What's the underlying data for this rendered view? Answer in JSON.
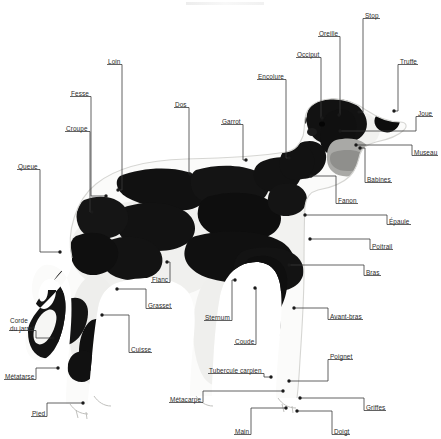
{
  "figure": {
    "language": "fr",
    "width": 441,
    "height": 439,
    "background_color": "#ffffff",
    "label_color": "#2b2b2b",
    "leader_color": "#3a3a3a",
    "dot_color": "#1a1a1a"
  },
  "labels": [
    {
      "id": "queue",
      "text": "Queue",
      "x": 18,
      "y": 163,
      "align": "left",
      "anchor_x": 60,
      "anchor_y": 252
    },
    {
      "id": "croupe",
      "text": "Croupe",
      "x": 66,
      "y": 125,
      "align": "left",
      "anchor_x": 92,
      "anchor_y": 212
    },
    {
      "id": "fesse",
      "text": "Fesse",
      "x": 71,
      "y": 90,
      "align": "left",
      "anchor_x": 106,
      "anchor_y": 196
    },
    {
      "id": "loin",
      "text": "Loin",
      "x": 108,
      "y": 58,
      "align": "left",
      "anchor_x": 118,
      "anchor_y": 190
    },
    {
      "id": "dos",
      "text": "Dos",
      "x": 175,
      "y": 101,
      "align": "left",
      "anchor_x": 190,
      "anchor_y": 174
    },
    {
      "id": "garrot",
      "text": "Garrot",
      "x": 222,
      "y": 118,
      "align": "left",
      "anchor_x": 246,
      "anchor_y": 160
    },
    {
      "id": "encolure",
      "text": "Encolure",
      "x": 258,
      "y": 73,
      "align": "left",
      "anchor_x": 289,
      "anchor_y": 158
    },
    {
      "id": "occiput",
      "text": "Occiput",
      "x": 297,
      "y": 51,
      "align": "left",
      "anchor_x": 322,
      "anchor_y": 118
    },
    {
      "id": "oreille",
      "text": "Oreille",
      "x": 319,
      "y": 30,
      "align": "left",
      "anchor_x": 339,
      "anchor_y": 115
    },
    {
      "id": "stop",
      "text": "Stop",
      "x": 365,
      "y": 12,
      "align": "left",
      "anchor_x": 359,
      "anchor_y": 112
    },
    {
      "id": "truffe",
      "text": "Truffe",
      "x": 400,
      "y": 58,
      "align": "left",
      "anchor_x": 394,
      "anchor_y": 111
    },
    {
      "id": "joue",
      "text": "Joue",
      "x": 418,
      "y": 110,
      "align": "left",
      "anchor_x": 340,
      "anchor_y": 131
    },
    {
      "id": "museau",
      "text": "Museau",
      "x": 414,
      "y": 149,
      "align": "left",
      "anchor_x": 356,
      "anchor_y": 145
    },
    {
      "id": "babines",
      "text": "Babines",
      "x": 367,
      "y": 176,
      "align": "left",
      "anchor_x": 360,
      "anchor_y": 148
    },
    {
      "id": "fanon",
      "text": "Fanon",
      "x": 338,
      "y": 197,
      "align": "left",
      "anchor_x": 311,
      "anchor_y": 176
    },
    {
      "id": "epaule",
      "text": "Épaule",
      "x": 389,
      "y": 218,
      "align": "left",
      "anchor_x": 305,
      "anchor_y": 215
    },
    {
      "id": "poitrail",
      "text": "Poitrail",
      "x": 372,
      "y": 243,
      "align": "left",
      "anchor_x": 310,
      "anchor_y": 239
    },
    {
      "id": "bras",
      "text": "Bras",
      "x": 366,
      "y": 269,
      "align": "left",
      "anchor_x": 289,
      "anchor_y": 265
    },
    {
      "id": "avant-bras",
      "text": "Avant-bras",
      "x": 330,
      "y": 313,
      "align": "left",
      "anchor_x": 294,
      "anchor_y": 308
    },
    {
      "id": "poignet",
      "text": "Poignet",
      "x": 330,
      "y": 353,
      "align": "left",
      "anchor_x": 289,
      "anchor_y": 381
    },
    {
      "id": "griffes",
      "text": "Griffes",
      "x": 366,
      "y": 404,
      "align": "left",
      "anchor_x": 300,
      "anchor_y": 398
    },
    {
      "id": "doigt",
      "text": "Doigt",
      "x": 334,
      "y": 428,
      "align": "left",
      "anchor_x": 297,
      "anchor_y": 411
    },
    {
      "id": "main",
      "text": "Main",
      "x": 235,
      "y": 428,
      "align": "left",
      "anchor_x": 286,
      "anchor_y": 408
    },
    {
      "id": "metacarpe",
      "text": "Métacarpe",
      "x": 170,
      "y": 396,
      "align": "left",
      "anchor_x": 283,
      "anchor_y": 391
    },
    {
      "id": "tubercule-carpien",
      "text": "Tubercule carpien",
      "x": 209,
      "y": 367,
      "align": "left",
      "anchor_x": 271,
      "anchor_y": 377
    },
    {
      "id": "coude",
      "text": "Coude",
      "x": 235,
      "y": 338,
      "align": "left",
      "anchor_x": 255,
      "anchor_y": 288
    },
    {
      "id": "sternum",
      "text": "Sternum",
      "x": 205,
      "y": 314,
      "align": "left",
      "anchor_x": 235,
      "anchor_y": 280
    },
    {
      "id": "flanc",
      "text": "Flanc",
      "x": 152,
      "y": 276,
      "align": "left",
      "anchor_x": 167,
      "anchor_y": 262
    },
    {
      "id": "grasset",
      "text": "Grasset",
      "x": 148,
      "y": 302,
      "align": "left",
      "anchor_x": 117,
      "anchor_y": 289
    },
    {
      "id": "cuisse",
      "text": "Cuisse",
      "x": 131,
      "y": 346,
      "align": "left",
      "anchor_x": 102,
      "anchor_y": 315
    },
    {
      "id": "corde-du-jarret",
      "text": "Corde\ndu jarret",
      "x": 10,
      "y": 317,
      "align": "left",
      "anchor_x": 53,
      "anchor_y": 338
    },
    {
      "id": "metatarse",
      "text": "Métatarse",
      "x": 5,
      "y": 373,
      "align": "left",
      "anchor_x": 58,
      "anchor_y": 368
    },
    {
      "id": "pied",
      "text": "Pied",
      "x": 32,
      "y": 410,
      "align": "left",
      "anchor_x": 83,
      "anchor_y": 403
    }
  ]
}
